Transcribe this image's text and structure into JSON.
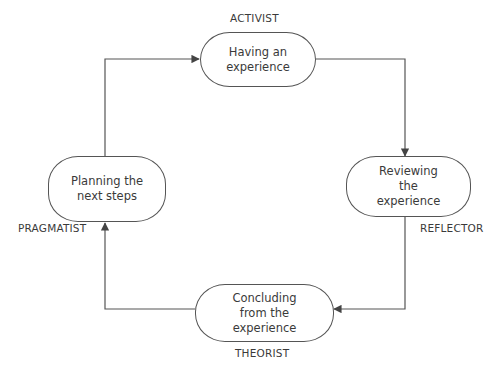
{
  "diagram": {
    "type": "cycle",
    "line_color": "#555555",
    "nodes": [
      {
        "id": "activist",
        "role": "ACTIVIST",
        "label_lines": [
          "Having an",
          "experience"
        ]
      },
      {
        "id": "reflector",
        "role": "REFLECTOR",
        "label_lines": [
          "Reviewing",
          "the",
          "experience"
        ]
      },
      {
        "id": "theorist",
        "role": "THEORIST",
        "label_lines": [
          "Concluding",
          "from the",
          "experience"
        ]
      },
      {
        "id": "pragmatist",
        "role": "PRAGMATIST",
        "label_lines": [
          "Planning the",
          "next steps"
        ]
      }
    ],
    "edges": [
      {
        "from": "activist",
        "to": "reflector"
      },
      {
        "from": "reflector",
        "to": "theorist"
      },
      {
        "from": "theorist",
        "to": "pragmatist"
      },
      {
        "from": "pragmatist",
        "to": "activist"
      }
    ]
  }
}
